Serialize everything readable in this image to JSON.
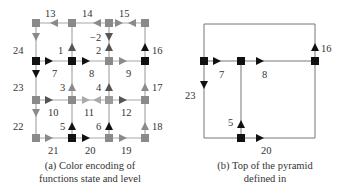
{
  "colors": {
    "gray": "#8a8a8a",
    "black": "#111111",
    "line": "#9a9a9a",
    "darkline": "#555555"
  },
  "panel_a": {
    "caption_line1": "(a) Color encoding of",
    "caption_line2": "functions state and level",
    "cols": [
      36,
      72,
      109,
      145
    ],
    "rows": [
      23,
      61,
      100,
      138
    ],
    "nodes": [
      {
        "c": 0,
        "r": 0,
        "color": "gray"
      },
      {
        "c": 1,
        "r": 0,
        "color": "gray"
      },
      {
        "c": 2,
        "r": 0,
        "color": "gray"
      },
      {
        "c": 3,
        "r": 0,
        "color": "gray"
      },
      {
        "c": 0,
        "r": 1,
        "color": "black"
      },
      {
        "c": 1,
        "r": 1,
        "color": "black"
      },
      {
        "c": 2,
        "r": 1,
        "color": "gray"
      },
      {
        "c": 3,
        "r": 1,
        "color": "black"
      },
      {
        "c": 0,
        "r": 2,
        "color": "gray"
      },
      {
        "c": 1,
        "r": 2,
        "color": "gray"
      },
      {
        "c": 2,
        "r": 2,
        "color": "gray"
      },
      {
        "c": 3,
        "r": 2,
        "color": "gray"
      },
      {
        "c": 0,
        "r": 3,
        "color": "gray"
      },
      {
        "c": 1,
        "r": 3,
        "color": "black"
      },
      {
        "c": 2,
        "r": 3,
        "color": "gray"
      },
      {
        "c": 3,
        "r": 3,
        "color": "gray"
      }
    ],
    "arrows": [
      {
        "id": "13",
        "x": 54,
        "y": 23,
        "dir": "left",
        "color": "gray",
        "lx": 45,
        "ly": 15
      },
      {
        "id": "14",
        "x": 97,
        "y": 23,
        "dir": "left",
        "color": "gray",
        "lx": 84,
        "ly": 15
      },
      {
        "id": "15a",
        "x": 119,
        "y": 23,
        "dir": "right",
        "color": "gray",
        "lx": 122,
        "ly": 15
      },
      {
        "id": "15b",
        "x": 132,
        "y": 23,
        "dir": "left",
        "color": "gray",
        "lx": null,
        "ly": null
      },
      {
        "id": "24",
        "x": 36,
        "y": 36,
        "dir": "down",
        "color": "gray",
        "lx": 15,
        "ly": 53
      },
      {
        "id": "1",
        "x": 72,
        "y": 48,
        "dir": "up",
        "color": "darkgray",
        "lx": 59,
        "ly": 53
      },
      {
        "id": "-2",
        "x": 109,
        "y": 36,
        "dir": "down",
        "color": "darkgray",
        "lx": 90,
        "ly": 41
      },
      {
        "id": "2",
        "x": 109,
        "y": 48,
        "dir": "up",
        "color": "darkgray",
        "lx": 96,
        "ly": 53
      },
      {
        "id": "16",
        "x": 145,
        "y": 48,
        "dir": "up",
        "color": "black",
        "lx": 152,
        "ly": 53
      },
      {
        "id": "7",
        "x": 49,
        "y": 61,
        "dir": "right",
        "color": "black",
        "lx": 51,
        "ly": 76
      },
      {
        "id": "8",
        "x": 86,
        "y": 61,
        "dir": "right",
        "color": "black",
        "lx": 89,
        "ly": 76
      },
      {
        "id": "9",
        "x": 123,
        "y": 61,
        "dir": "right",
        "color": "gray",
        "lx": 126,
        "ly": 76
      },
      {
        "id": "23",
        "x": 36,
        "y": 73,
        "dir": "down",
        "color": "black",
        "lx": 15,
        "ly": 91
      },
      {
        "id": "3",
        "x": 72,
        "y": 88,
        "dir": "up",
        "color": "gray",
        "lx": 60,
        "ly": 91
      },
      {
        "id": "4",
        "x": 109,
        "y": 88,
        "dir": "up",
        "color": "darkgray",
        "lx": 96,
        "ly": 91
      },
      {
        "id": "17",
        "x": 145,
        "y": 88,
        "dir": "up",
        "color": "gray",
        "lx": 152,
        "ly": 91
      },
      {
        "id": "10",
        "x": 49,
        "y": 100,
        "dir": "right",
        "color": "darkgray",
        "lx": 50,
        "ly": 116
      },
      {
        "id": "11a",
        "x": 86,
        "y": 100,
        "dir": "right",
        "color": "lightgray",
        "lx": 86,
        "ly": 116
      },
      {
        "id": "11b",
        "x": 97,
        "y": 100,
        "dir": "left",
        "color": "lightgray",
        "lx": null,
        "ly": null
      },
      {
        "id": "12",
        "x": 123,
        "y": 100,
        "dir": "right",
        "color": "darkgray",
        "lx": 125,
        "ly": 116
      },
      {
        "id": "22",
        "x": 36,
        "y": 113,
        "dir": "down",
        "color": "gray",
        "lx": 15,
        "ly": 130
      },
      {
        "id": "5",
        "x": 72,
        "y": 126,
        "dir": "up",
        "color": "black",
        "lx": 60,
        "ly": 130
      },
      {
        "id": "6",
        "x": 109,
        "y": 126,
        "dir": "up",
        "color": "black",
        "lx": 96,
        "ly": 130
      },
      {
        "id": "18",
        "x": 145,
        "y": 126,
        "dir": "up",
        "color": "gray",
        "lx": 152,
        "ly": 130
      },
      {
        "id": "21",
        "x": 49,
        "y": 138,
        "dir": "right",
        "color": "gray",
        "lx": 49,
        "ly": 154
      },
      {
        "id": "20",
        "x": 86,
        "y": 138,
        "dir": "right",
        "color": "black",
        "lx": 87,
        "ly": 154
      },
      {
        "id": "19",
        "x": 123,
        "y": 138,
        "dir": "right",
        "color": "gray",
        "lx": 123,
        "ly": 154
      }
    ],
    "labels": {
      "l13": "13",
      "l14": "14",
      "l15": "15",
      "l24": "24",
      "l1": "1",
      "lm2": "−2",
      "l2": "2",
      "l16": "16",
      "l7": "7",
      "l8": "8",
      "l9": "9",
      "l23": "23",
      "l3": "3",
      "l4": "4",
      "l17": "17",
      "l10": "10",
      "l11": "11",
      "l12": "12",
      "l22": "22",
      "l5": "5",
      "l6": "6",
      "l18": "18",
      "l21": "21",
      "l20": "20",
      "l19": "19"
    }
  },
  "panel_b": {
    "caption_line1": "(b) Top of the pyramid",
    "caption_line2": "defined in",
    "labels": {
      "l7": "7",
      "l8": "8",
      "l16": "16",
      "l23": "23",
      "l5": "5",
      "l20": "20"
    }
  }
}
